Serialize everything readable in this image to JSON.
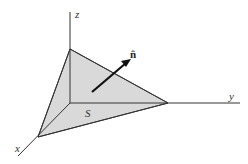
{
  "diagram": {
    "axes": {
      "x_label": "x",
      "y_label": "y",
      "z_label": "z"
    },
    "surface_label": "S",
    "normal_label": "n̂",
    "colors": {
      "surface_fill": "#d9d9d9",
      "lines": "#333333",
      "background": "#ffffff"
    }
  }
}
